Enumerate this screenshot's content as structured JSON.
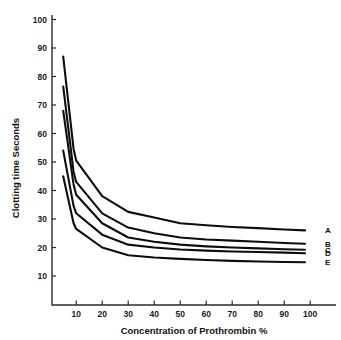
{
  "chart_data": {
    "type": "line",
    "title": "",
    "xlabel": "Concentration of Prothrombin %",
    "ylabel": "Clotting time Seconds",
    "xlim": [
      0,
      104
    ],
    "ylim": [
      5,
      104
    ],
    "xticks": [
      10,
      20,
      30,
      40,
      50,
      60,
      70,
      80,
      90,
      100
    ],
    "yticks": [
      10,
      20,
      30,
      40,
      50,
      60,
      70,
      80,
      90,
      100
    ],
    "xtick_labels": [
      "10",
      "20",
      "30",
      "40",
      "50",
      "60",
      "70",
      "80",
      "90",
      "100"
    ],
    "ytick_labels": [
      "10",
      "20",
      "30",
      "40",
      "50",
      "60",
      "70",
      "80",
      "90",
      "100"
    ],
    "grid": false,
    "legend_position": "right-end-labels",
    "line_color": "#0d0d0d",
    "axis_color": "#2b2b2b",
    "background": "#ffffff",
    "x": [
      5,
      9,
      10,
      20,
      30,
      40,
      50,
      60,
      70,
      80,
      90,
      98
    ],
    "series": [
      {
        "name": "A",
        "label": "A",
        "values": [
          87.0,
          54.5,
          50.5,
          38.0,
          32.5,
          30.5,
          28.5,
          27.8,
          27.2,
          26.8,
          26.3,
          26.0
        ]
      },
      {
        "name": "B",
        "label": "B",
        "values": [
          76.5,
          46.5,
          43.0,
          32.0,
          27.0,
          25.0,
          23.5,
          22.8,
          22.4,
          22.0,
          21.6,
          21.3
        ]
      },
      {
        "name": "C",
        "label": "C",
        "values": [
          68.0,
          42.0,
          38.5,
          28.5,
          23.5,
          22.0,
          21.0,
          20.4,
          20.0,
          19.7,
          19.4,
          19.2
        ]
      },
      {
        "name": "D",
        "label": "D",
        "values": [
          54.0,
          34.5,
          32.0,
          24.5,
          21.0,
          20.0,
          19.3,
          18.9,
          18.6,
          18.4,
          18.2,
          18.0
        ]
      },
      {
        "name": "E",
        "label": "E",
        "values": [
          45.0,
          28.5,
          26.5,
          20.0,
          17.3,
          16.5,
          16.0,
          15.6,
          15.3,
          15.1,
          14.9,
          14.8
        ]
      }
    ]
  },
  "axes": {
    "x_title": "Concentration of Prothrombin %",
    "y_title": "Clotting time Seconds"
  },
  "series_labels": {
    "a": "A",
    "b": "B",
    "c": "C",
    "d": "D",
    "e": "E"
  },
  "ticks": {
    "x": [
      "10",
      "20",
      "30",
      "40",
      "50",
      "60",
      "70",
      "80",
      "90",
      "100"
    ],
    "y": [
      "10",
      "20",
      "30",
      "40",
      "50",
      "60",
      "70",
      "80",
      "90",
      "100"
    ]
  }
}
